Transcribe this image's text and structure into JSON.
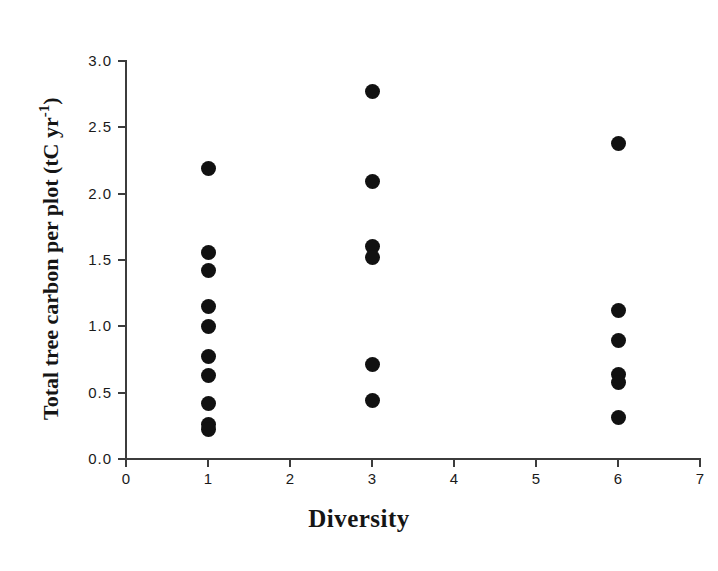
{
  "chart_data": {
    "type": "scatter",
    "title": "",
    "xlabel": "Diversity",
    "ylabel": "Total tree carbon per plot (tC yr-1)",
    "ylabel_parts": {
      "main": "Total tree carbon per plot (tC yr",
      "superscript": "-1",
      "tail": ")"
    },
    "xlim": [
      0,
      7
    ],
    "ylim": [
      0.0,
      3.0
    ],
    "grid": false,
    "legend": null,
    "xticks": [
      "0",
      "1",
      "2",
      "3",
      "4",
      "5",
      "6",
      "7"
    ],
    "xtick_values": [
      0,
      1,
      2,
      3,
      4,
      5,
      6,
      7
    ],
    "yticks": [
      "0.0",
      "0.5",
      "1.0",
      "1.5",
      "2.0",
      "2.5",
      "3.0"
    ],
    "ytick_values": [
      0.0,
      0.5,
      1.0,
      1.5,
      2.0,
      2.5,
      3.0
    ],
    "marker": "filled-circle",
    "marker_color": "#111111",
    "axis_color": "#3c3c3c",
    "points": [
      {
        "x": 1,
        "y": 2.19
      },
      {
        "x": 1,
        "y": 1.56
      },
      {
        "x": 1,
        "y": 1.42
      },
      {
        "x": 1,
        "y": 1.15
      },
      {
        "x": 1,
        "y": 1.0
      },
      {
        "x": 1,
        "y": 0.77
      },
      {
        "x": 1,
        "y": 0.63
      },
      {
        "x": 1,
        "y": 0.42
      },
      {
        "x": 1,
        "y": 0.26
      },
      {
        "x": 1,
        "y": 0.22
      },
      {
        "x": 3,
        "y": 2.77
      },
      {
        "x": 3,
        "y": 2.09
      },
      {
        "x": 3,
        "y": 1.6
      },
      {
        "x": 3,
        "y": 1.52
      },
      {
        "x": 3,
        "y": 0.71
      },
      {
        "x": 3,
        "y": 0.44
      },
      {
        "x": 6,
        "y": 2.38
      },
      {
        "x": 6,
        "y": 1.12
      },
      {
        "x": 6,
        "y": 0.89
      },
      {
        "x": 6,
        "y": 0.64
      },
      {
        "x": 6,
        "y": 0.58
      },
      {
        "x": 6,
        "y": 0.31
      }
    ]
  }
}
